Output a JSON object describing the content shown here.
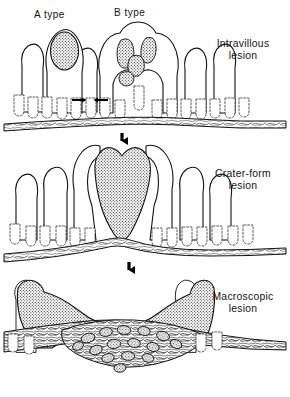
{
  "figure": {
    "background_color": "#ffffff",
    "ink_color": "#111111"
  },
  "panels": [
    {
      "id": "panel-intravillous",
      "stage_number": 1,
      "label_line1": "Intravillous",
      "label_line2": "lesion",
      "type_labels": [
        {
          "id": "a-type",
          "text": "A  type"
        },
        {
          "id": "b-type",
          "text": "B  type"
        }
      ],
      "annotation_arrows": "paired converging arrows between adjacent villi"
    },
    {
      "id": "panel-crater-form",
      "stage_number": 2,
      "label_line1": "Crater-form",
      "label_line2": "lesion",
      "type_labels": [],
      "annotation_arrows": ""
    },
    {
      "id": "panel-macroscopic",
      "stage_number": 3,
      "label_line1": "Macroscopic",
      "label_line2": "lesion",
      "type_labels": [],
      "annotation_arrows": ""
    }
  ],
  "transition_arrows": [
    {
      "id": "arrow-stage-1-to-2",
      "direction": "down"
    },
    {
      "id": "arrow-stage-2-to-3",
      "direction": "down"
    }
  ]
}
